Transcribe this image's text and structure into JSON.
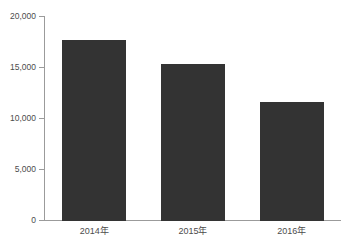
{
  "chart_data": {
    "type": "bar",
    "title": "",
    "subtitle": "",
    "xlabel": "",
    "ylabel": "",
    "categories": [
      "2014年",
      "2015年",
      "2016年"
    ],
    "values": [
      17750,
      15400,
      11700
    ],
    "series": [
      {
        "name": "",
        "values": [
          17750,
          15400,
          11700
        ]
      }
    ],
    "ylim": [
      0,
      20000
    ],
    "yticks": [
      0,
      5000,
      10000,
      15000,
      20000
    ],
    "ytick_labels": [
      "0",
      "5,000",
      "10,000",
      "15,000",
      "20,000"
    ],
    "grid": false,
    "legend": null,
    "legend_position": "none",
    "bar_color": "#333333",
    "axis_color": "#9b9b9b",
    "text_color": "#4c4c4c",
    "background_color": "#ffffff",
    "annotations": []
  }
}
